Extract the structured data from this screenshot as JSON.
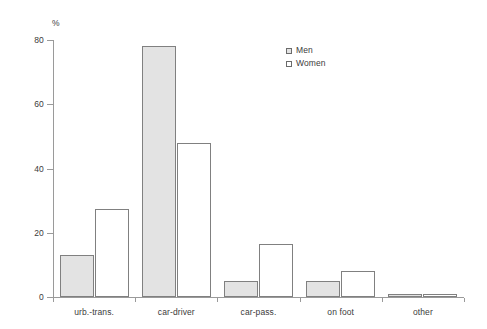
{
  "chart_data": {
    "type": "bar",
    "title": "",
    "subtitle": "",
    "xlabel": "",
    "ylabel": "%",
    "ylim": [
      0,
      80
    ],
    "yticks": [
      0,
      20,
      40,
      60,
      80
    ],
    "grid": false,
    "legend_position": "top-right",
    "categories": [
      "urb.-trans.",
      "car-driver",
      "car-pass.",
      "on foot",
      "other"
    ],
    "series": [
      {
        "name": "Men",
        "values": [
          13,
          78,
          5,
          5,
          1
        ],
        "fill": "#e3e3e3",
        "stroke": "#808080"
      },
      {
        "name": "Women",
        "values": [
          27.5,
          48,
          16.5,
          8,
          1
        ],
        "fill": "#ffffff",
        "stroke": "#808080"
      }
    ]
  },
  "axis": {
    "unit_label": "%",
    "tick_labels": [
      "0",
      "20",
      "40",
      "60",
      "80"
    ]
  },
  "legend": {
    "items": [
      {
        "label": "Men"
      },
      {
        "label": "Women"
      }
    ]
  }
}
